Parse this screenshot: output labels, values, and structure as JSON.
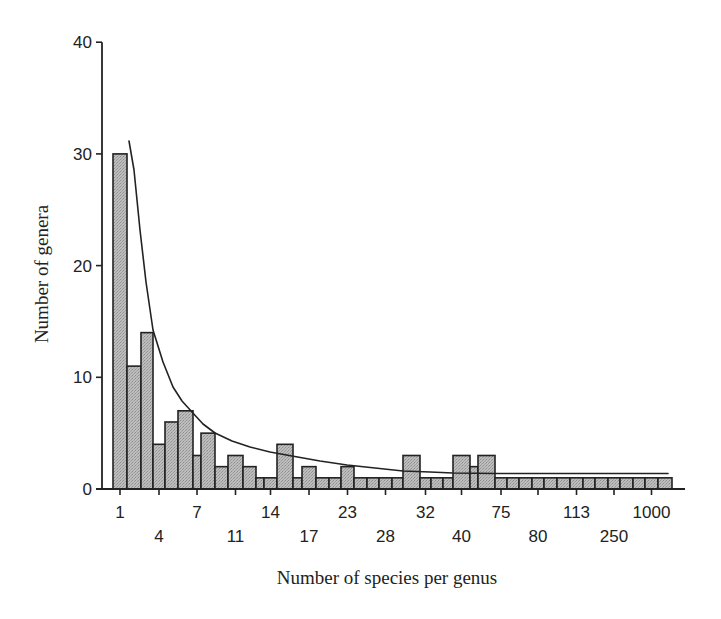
{
  "chart_data": {
    "type": "bar",
    "title": "",
    "xlabel": "Number of species per genus",
    "ylabel": "Number of genera",
    "ylim": [
      0,
      40
    ],
    "yticks": [
      0,
      10,
      20,
      30,
      40
    ],
    "grid": false,
    "legend": null,
    "x_tick_labels": [
      {
        "label": "1",
        "bar_index": 0,
        "row": 0
      },
      {
        "label": "4",
        "bar_index": 3,
        "row": 1
      },
      {
        "label": "7",
        "bar_index": 6,
        "row": 0
      },
      {
        "label": "11",
        "bar_index": 9,
        "row": 1
      },
      {
        "label": "14",
        "bar_index": 12,
        "row": 0
      },
      {
        "label": "17",
        "bar_index": 15,
        "row": 1
      },
      {
        "label": "23",
        "bar_index": 18,
        "row": 0
      },
      {
        "label": "28",
        "bar_index": 21,
        "row": 1
      },
      {
        "label": "32",
        "bar_index": 24,
        "row": 0
      },
      {
        "label": "40",
        "bar_index": 27,
        "row": 1
      },
      {
        "label": "75",
        "bar_index": 30,
        "row": 0
      },
      {
        "label": "80",
        "bar_index": 33,
        "row": 1
      },
      {
        "label": "113",
        "bar_index": 36,
        "row": 0
      },
      {
        "label": "250",
        "bar_index": 39,
        "row": 1
      },
      {
        "label": "1000",
        "bar_index": 42,
        "row": 0
      }
    ],
    "bars": [
      {
        "x0": 113,
        "x1": 127,
        "value": 30
      },
      {
        "x0": 127,
        "x1": 141,
        "value": 11
      },
      {
        "x0": 141,
        "x1": 153,
        "value": 14
      },
      {
        "x0": 153,
        "x1": 165,
        "value": 4
      },
      {
        "x0": 165,
        "x1": 178,
        "value": 6
      },
      {
        "x0": 178,
        "x1": 193,
        "value": 7
      },
      {
        "x0": 193,
        "x1": 201,
        "value": 3
      },
      {
        "x0": 201,
        "x1": 215,
        "value": 5
      },
      {
        "x0": 215,
        "x1": 228,
        "value": 2
      },
      {
        "x0": 228,
        "x1": 243,
        "value": 3
      },
      {
        "x0": 243,
        "x1": 256,
        "value": 2
      },
      {
        "x0": 256,
        "x1": 264,
        "value": 1
      },
      {
        "x0": 264,
        "x1": 277,
        "value": 1
      },
      {
        "x0": 277,
        "x1": 293,
        "value": 4
      },
      {
        "x0": 293,
        "x1": 302,
        "value": 1
      },
      {
        "x0": 302,
        "x1": 316,
        "value": 2
      },
      {
        "x0": 316,
        "x1": 329,
        "value": 1
      },
      {
        "x0": 329,
        "x1": 341,
        "value": 1
      },
      {
        "x0": 341,
        "x1": 354,
        "value": 2
      },
      {
        "x0": 354,
        "x1": 367,
        "value": 1
      },
      {
        "x0": 367,
        "x1": 379,
        "value": 1
      },
      {
        "x0": 379,
        "x1": 392,
        "value": 1
      },
      {
        "x0": 392,
        "x1": 403,
        "value": 1
      },
      {
        "x0": 403,
        "x1": 420,
        "value": 3
      },
      {
        "x0": 420,
        "x1": 431,
        "value": 1
      },
      {
        "x0": 431,
        "x1": 443,
        "value": 1
      },
      {
        "x0": 443,
        "x1": 453,
        "value": 1
      },
      {
        "x0": 453,
        "x1": 470,
        "value": 3
      },
      {
        "x0": 470,
        "x1": 478,
        "value": 2
      },
      {
        "x0": 478,
        "x1": 495,
        "value": 3
      },
      {
        "x0": 495,
        "x1": 507,
        "value": 1
      },
      {
        "x0": 507,
        "x1": 519,
        "value": 1
      },
      {
        "x0": 519,
        "x1": 532,
        "value": 1
      },
      {
        "x0": 532,
        "x1": 544,
        "value": 1
      },
      {
        "x0": 544,
        "x1": 557,
        "value": 1
      },
      {
        "x0": 557,
        "x1": 570,
        "value": 1
      },
      {
        "x0": 570,
        "x1": 583,
        "value": 1
      },
      {
        "x0": 583,
        "x1": 595,
        "value": 1
      },
      {
        "x0": 595,
        "x1": 608,
        "value": 1
      },
      {
        "x0": 608,
        "x1": 620,
        "value": 1
      },
      {
        "x0": 620,
        "x1": 633,
        "value": 1
      },
      {
        "x0": 633,
        "x1": 645,
        "value": 1
      },
      {
        "x0": 645,
        "x1": 658,
        "value": 1
      },
      {
        "x0": 658,
        "x1": 672,
        "value": 1
      }
    ],
    "values": [
      30,
      11,
      14,
      4,
      6,
      7,
      3,
      5,
      2,
      3,
      2,
      1,
      1,
      4,
      1,
      2,
      1,
      1,
      2,
      1,
      1,
      1,
      1,
      3,
      1,
      1,
      1,
      3,
      2,
      3,
      1,
      1,
      1,
      1,
      1,
      1,
      1,
      1,
      1,
      1,
      1,
      1,
      1,
      1
    ],
    "fitted_curve": {
      "description": "Decreasing hyperbolic-like fit curve",
      "points_px": [
        [
          129,
          141
        ],
        [
          134,
          170
        ],
        [
          140,
          230
        ],
        [
          146,
          282
        ],
        [
          153,
          330
        ],
        [
          163,
          362
        ],
        [
          173,
          387
        ],
        [
          182,
          401
        ],
        [
          192,
          412
        ],
        [
          203,
          424
        ],
        [
          215,
          433
        ],
        [
          232,
          441
        ],
        [
          250,
          447
        ],
        [
          270,
          452
        ],
        [
          292,
          456
        ],
        [
          320,
          461
        ],
        [
          347,
          465
        ],
        [
          375,
          468
        ],
        [
          403,
          471
        ],
        [
          430,
          472
        ],
        [
          453,
          473
        ],
        [
          497,
          473.5
        ],
        [
          560,
          473.5
        ],
        [
          620,
          473.5
        ],
        [
          668,
          473.5
        ]
      ]
    },
    "colors": {
      "bar_fill": "#b5b5b5",
      "bar_stroke": "#222222",
      "axis": "#222222",
      "curve": "#222222",
      "background": "#ffffff"
    }
  },
  "axes": {
    "y_ticks": [
      {
        "label": "0",
        "value": 0
      },
      {
        "label": "10",
        "value": 10
      },
      {
        "label": "20",
        "value": 20
      },
      {
        "label": "30",
        "value": 30
      },
      {
        "label": "40",
        "value": 40
      }
    ],
    "x_title": "Number of species per genus",
    "y_title": "Number of genera"
  }
}
